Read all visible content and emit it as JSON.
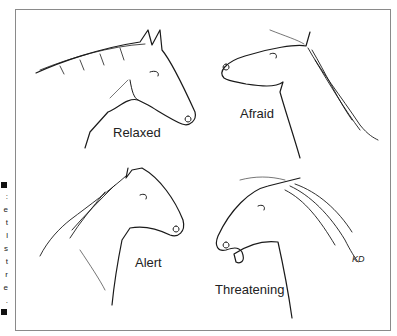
{
  "figure": {
    "panels": [
      {
        "id": "relaxed",
        "label": "Relaxed"
      },
      {
        "id": "afraid",
        "label": "Afraid"
      },
      {
        "id": "alert",
        "label": "Alert"
      },
      {
        "id": "threatening",
        "label": "Threatening"
      }
    ],
    "signature": "KD",
    "clipped_caption_glyphs": [
      ":",
      "e",
      "t",
      "l",
      "s",
      "t",
      "r",
      "e",
      "."
    ]
  }
}
